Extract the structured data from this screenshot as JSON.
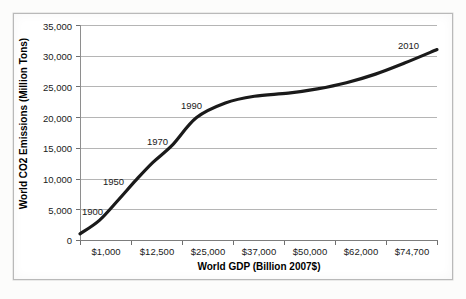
{
  "chart_data": {
    "type": "line",
    "title": "",
    "xlabel": "World GDP (Billion 2007$)",
    "ylabel": "World CO2 Emissions (Million Tons)",
    "x_tick_labels": [
      "$1,000",
      "$12,500",
      "$25,000",
      "$37,000",
      "$50,000",
      "$62,000",
      "$74,700"
    ],
    "y_tick_labels": [
      "0",
      "5,000",
      "10,000",
      "15,000",
      "20,000",
      "25,000",
      "30,000",
      "35,000"
    ],
    "y_ticks": [
      0,
      5000,
      10000,
      15000,
      20000,
      25000,
      30000,
      35000
    ],
    "ylim": [
      0,
      35000
    ],
    "xlim": [
      1000,
      74700
    ],
    "grid": "horizontal",
    "legend": "none",
    "series": [
      {
        "name": "World CO2 Emissions",
        "color": "#1a1a1a",
        "x": [
          1000,
          5000,
          9000,
          12500,
          16000,
          20000,
          25000,
          31000,
          37000,
          44000,
          50000,
          56000,
          62000,
          68000,
          74700
        ],
        "y": [
          1000,
          3200,
          6600,
          9700,
          12600,
          15400,
          19900,
          22300,
          23400,
          23900,
          24600,
          25600,
          27000,
          28800,
          31000
        ]
      }
    ],
    "annotations": [
      {
        "label": "1900",
        "gdp": 1000,
        "emissions": 1000,
        "x_px": 82,
        "y_px": 206
      },
      {
        "label": "1950",
        "gdp": 9000,
        "emissions": 6600,
        "x_px": 103,
        "y_px": 176
      },
      {
        "label": "1970",
        "gdp": 16000,
        "emissions": 12600,
        "x_px": 147,
        "y_px": 136
      },
      {
        "label": "1990",
        "gdp": 25000,
        "emissions": 19900,
        "x_px": 181,
        "y_px": 100
      },
      {
        "label": "2010",
        "gdp": 74700,
        "emissions": 31000,
        "x_px": 398,
        "y_px": 40
      }
    ]
  },
  "axes": {
    "y_title": "World CO2 Emissions (Million Tons)",
    "x_title": "World GDP (Billion 2007$)"
  },
  "colors": {
    "series_line": "#1a1a1a",
    "gridline": "#b5b5b5",
    "axis": "#7d7d7d",
    "frame": "#b9b9b9",
    "text": "#1a1a1a",
    "background": "#ffffff"
  }
}
